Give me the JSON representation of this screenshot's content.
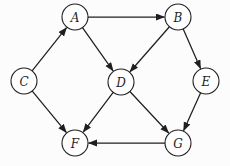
{
  "diagram": {
    "type": "directed-graph",
    "background": "#fcfcfc",
    "node_fill": "#ffffff",
    "node_stroke": "#1f1f1f",
    "edge_color": "#1f1f1f",
    "label_color": "#1f1f1f",
    "node_radius": 13,
    "nodes": [
      {
        "id": "A",
        "label": "A",
        "x": 75,
        "y": 17
      },
      {
        "id": "B",
        "label": "B",
        "x": 178,
        "y": 17
      },
      {
        "id": "C",
        "label": "C",
        "x": 24,
        "y": 81
      },
      {
        "id": "D",
        "label": "D",
        "x": 121,
        "y": 82
      },
      {
        "id": "E",
        "label": "E",
        "x": 206,
        "y": 81
      },
      {
        "id": "F",
        "label": "F",
        "x": 75,
        "y": 143
      },
      {
        "id": "G",
        "label": "G",
        "x": 178,
        "y": 143
      }
    ],
    "edges": [
      {
        "from": "C",
        "to": "A"
      },
      {
        "from": "A",
        "to": "B"
      },
      {
        "from": "A",
        "to": "D"
      },
      {
        "from": "B",
        "to": "D"
      },
      {
        "from": "B",
        "to": "E"
      },
      {
        "from": "C",
        "to": "F"
      },
      {
        "from": "D",
        "to": "F"
      },
      {
        "from": "D",
        "to": "G"
      },
      {
        "from": "E",
        "to": "G"
      },
      {
        "from": "G",
        "to": "F"
      }
    ]
  }
}
